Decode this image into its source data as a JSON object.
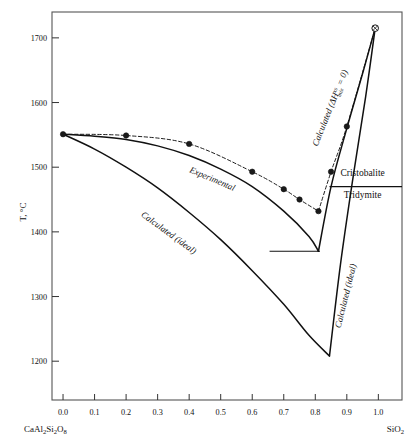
{
  "figure": {
    "title": "",
    "y_axis_label": "T, °C",
    "left_endmember": "CaAl₂Si₂O₈",
    "right_endmember": "SiO₂"
  },
  "labels": {
    "experimental": "Experimental",
    "calculated_ideal_left": "Calculated (ideal)",
    "calculated_ideal_right": "Calculated (ideal)",
    "calculated_hmix": "Calculated (ΔHˣˢₘᵢₓ = 0)",
    "calculated_hmix_plain": "Calculated (",
    "calculated_hmix_delta": "ΔH",
    "calculated_hmix_sup": "xs",
    "calculated_hmix_sub": "mix",
    "calculated_hmix_tail": " = 0)",
    "cristobalite": "Cristobalite",
    "tridymite": "Tridymite"
  },
  "chart_data": {
    "type": "line",
    "title": "",
    "xlabel": "",
    "ylabel": "T, °C",
    "xlim": [
      -0.035,
      1.075
    ],
    "ylim": [
      1140,
      1740
    ],
    "grid": false,
    "legend": "inline-annotations",
    "x_ticks": [
      "0.0",
      "0.1",
      "0.2",
      "0.3",
      "0.4",
      "0.5",
      "0.6",
      "0.7",
      "0.8",
      "0.9",
      "1.0"
    ],
    "x_tick_values": [
      0.0,
      0.1,
      0.2,
      0.3,
      0.4,
      0.5,
      0.6,
      0.7,
      0.8,
      0.9,
      1.0
    ],
    "y_ticks": [
      "1200",
      "1300",
      "1400",
      "1500",
      "1600",
      "1700"
    ],
    "y_tick_values": [
      1200,
      1300,
      1400,
      1500,
      1600,
      1700
    ],
    "series": [
      {
        "name": "Experimental",
        "style": "dashed-with-markers",
        "marker": "filled-circle",
        "x": [
          0.0,
          0.2,
          0.4,
          0.6,
          0.7,
          0.75,
          0.81,
          0.85,
          0.9,
          0.99
        ],
        "y": [
          1551,
          1549,
          1536,
          1493,
          1466,
          1450,
          1432,
          1493,
          1563,
          1715
        ]
      },
      {
        "name": "Calculated (ΔHxs_mix = 0)",
        "style": "solid",
        "x": [
          0.0,
          0.1,
          0.2,
          0.3,
          0.4,
          0.5,
          0.6,
          0.7,
          0.78,
          0.81,
          0.85,
          0.9,
          0.95,
          0.99
        ],
        "y": [
          1551,
          1548,
          1543,
          1533,
          1518,
          1497,
          1470,
          1432,
          1393,
          1370,
          1470,
          1560,
          1645,
          1715
        ]
      },
      {
        "name": "Calculated (ideal)",
        "style": "solid",
        "x": [
          0.0,
          0.1,
          0.2,
          0.3,
          0.4,
          0.5,
          0.6,
          0.7,
          0.78,
          0.845,
          0.88,
          0.92,
          0.96,
          0.99
        ],
        "y": [
          1551,
          1528,
          1500,
          1468,
          1430,
          1388,
          1340,
          1288,
          1240,
          1208,
          1350,
          1485,
          1610,
          1715
        ]
      }
    ],
    "markers": [
      {
        "x": 0.0,
        "y": 1551,
        "type": "filled-circle"
      },
      {
        "x": 0.2,
        "y": 1549,
        "type": "filled-circle"
      },
      {
        "x": 0.4,
        "y": 1536,
        "type": "filled-circle"
      },
      {
        "x": 0.6,
        "y": 1493,
        "type": "filled-circle"
      },
      {
        "x": 0.7,
        "y": 1466,
        "type": "filled-circle"
      },
      {
        "x": 0.75,
        "y": 1450,
        "type": "filled-circle"
      },
      {
        "x": 0.81,
        "y": 1432,
        "type": "filled-circle"
      },
      {
        "x": 0.85,
        "y": 1493,
        "type": "filled-circle"
      },
      {
        "x": 0.9,
        "y": 1563,
        "type": "filled-circle"
      },
      {
        "x": 0.99,
        "y": 1715,
        "type": "crossed-open-circle"
      }
    ],
    "horizontal_lines": [
      {
        "name": "cristobalite-tridymite-transition",
        "y": 1470,
        "x_start": 0.845,
        "x_end": 1.075
      },
      {
        "name": "eutectic-tie-line",
        "y": 1370,
        "x_start": 0.655,
        "x_end": 0.815
      }
    ],
    "annotations": [
      {
        "text": "Experimental",
        "x": 0.47,
        "y": 1478,
        "rotation": 23
      },
      {
        "text": "Calculated (ideal)",
        "x": 0.33,
        "y": 1395,
        "rotation": 36
      },
      {
        "text": "Calculated (ideal)",
        "x": 0.905,
        "y": 1300,
        "rotation": -76
      },
      {
        "text": "Calculated (ΔHxs_mix = 0)",
        "x": 0.855,
        "y": 1590,
        "rotation": -68
      },
      {
        "text": "Cristobalite",
        "x": 0.95,
        "y": 1487,
        "rotation": 0
      },
      {
        "text": "Tridymite",
        "x": 0.95,
        "y": 1452,
        "rotation": 0
      }
    ],
    "colors": {
      "line": "#111111",
      "marker_fill": "#1a1a1a",
      "frame": "#555555",
      "background": "#ffffff"
    }
  }
}
